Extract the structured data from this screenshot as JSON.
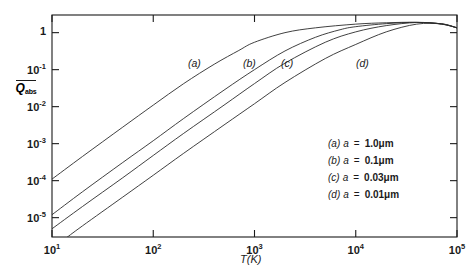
{
  "chart_data": {
    "type": "line",
    "title": "",
    "xlabel": "T(K)",
    "ylabel": "Q_abs",
    "ylabel_display": "Q",
    "ylabel_sub": "abs",
    "xscale": "log",
    "yscale": "log",
    "xlim": [
      10,
      100000
    ],
    "ylim": [
      3e-06,
      3
    ],
    "grid": false,
    "legend_position": "inside-lower-right",
    "xticks": [
      {
        "value": 10,
        "label": "10",
        "exp": "1"
      },
      {
        "value": 100,
        "label": "10",
        "exp": "2"
      },
      {
        "value": 1000,
        "label": "10",
        "exp": "3"
      },
      {
        "value": 10000,
        "label": "10",
        "exp": "4"
      },
      {
        "value": 100000,
        "label": "10",
        "exp": "5"
      }
    ],
    "yticks": [
      {
        "value": 1,
        "label": "1",
        "exp": ""
      },
      {
        "value": 0.1,
        "label": "10",
        "exp": "-1"
      },
      {
        "value": 0.01,
        "label": "10",
        "exp": "-2"
      },
      {
        "value": 0.001,
        "label": "10",
        "exp": "-3"
      },
      {
        "value": 0.0001,
        "label": "10",
        "exp": "-4"
      },
      {
        "value": 1e-05,
        "label": "10",
        "exp": "-5"
      }
    ],
    "series": [
      {
        "name": "a",
        "tag": "(a)",
        "grain_radius_um": 1.0,
        "tag_x": 188,
        "tag_y": 57,
        "points": [
          [
            10,
            0.00011
          ],
          [
            20,
            0.00045
          ],
          [
            50,
            0.0028
          ],
          [
            100,
            0.011
          ],
          [
            200,
            0.042
          ],
          [
            400,
            0.14
          ],
          [
            700,
            0.33
          ],
          [
            1000,
            0.55
          ],
          [
            2000,
            1.0
          ],
          [
            4000,
            1.35
          ],
          [
            10000,
            1.7
          ],
          [
            20000,
            1.85
          ],
          [
            40000,
            1.9
          ],
          [
            70000,
            1.7
          ],
          [
            100000,
            1.35
          ]
        ]
      },
      {
        "name": "b",
        "tag": "(b)",
        "grain_radius_um": 0.1,
        "tag_x": 243,
        "tag_y": 57,
        "points": [
          [
            10,
            1.2e-05
          ],
          [
            20,
            5e-05
          ],
          [
            50,
            0.00031
          ],
          [
            100,
            0.0012
          ],
          [
            200,
            0.0048
          ],
          [
            500,
            0.028
          ],
          [
            1000,
            0.1
          ],
          [
            2000,
            0.32
          ],
          [
            4000,
            0.75
          ],
          [
            7000,
            1.2
          ],
          [
            10000,
            1.45
          ],
          [
            20000,
            1.75
          ],
          [
            40000,
            1.9
          ],
          [
            70000,
            1.72
          ],
          [
            100000,
            1.35
          ]
        ]
      },
      {
        "name": "c",
        "tag": "(c)",
        "grain_radius_um": 0.03,
        "tag_x": 281,
        "tag_y": 57,
        "points": [
          [
            10,
            5e-06
          ],
          [
            20,
            2e-05
          ],
          [
            50,
            0.00012
          ],
          [
            100,
            0.00048
          ],
          [
            200,
            0.0019
          ],
          [
            500,
            0.011
          ],
          [
            1000,
            0.042
          ],
          [
            2000,
            0.15
          ],
          [
            5000,
            0.55
          ],
          [
            10000,
            1.05
          ],
          [
            20000,
            1.55
          ],
          [
            40000,
            1.88
          ],
          [
            70000,
            1.73
          ],
          [
            100000,
            1.35
          ]
        ]
      },
      {
        "name": "d",
        "tag": "(d)",
        "grain_radius_um": 0.01,
        "tag_x": 356,
        "tag_y": 57,
        "points": [
          [
            13,
            2.5e-06
          ],
          [
            20,
            6e-06
          ],
          [
            50,
            3.6e-05
          ],
          [
            100,
            0.00014
          ],
          [
            200,
            0.00055
          ],
          [
            500,
            0.0032
          ],
          [
            1000,
            0.012
          ],
          [
            2000,
            0.045
          ],
          [
            5000,
            0.2
          ],
          [
            10000,
            0.48
          ],
          [
            20000,
            1.05
          ],
          [
            40000,
            1.7
          ],
          [
            70000,
            1.74
          ],
          [
            100000,
            1.35
          ]
        ]
      }
    ]
  },
  "axes": {
    "xlabel_text": "T(K)",
    "ylabel_letter": "Q",
    "ylabel_sub": "abs"
  },
  "legend": {
    "entries": [
      {
        "key": "(a)",
        "var": "a",
        "eq": "=",
        "value": "1.0μm"
      },
      {
        "key": "(b)",
        "var": "a",
        "eq": "=",
        "value": "0.1μm"
      },
      {
        "key": "(c)",
        "var": "a",
        "eq": "=",
        "value": "0.03μm"
      },
      {
        "key": "(d)",
        "var": "a",
        "eq": "=",
        "value": "0.01μm"
      }
    ]
  },
  "colors": {
    "background": "#ffffff",
    "axis": "#1a1a1a",
    "curve": "#2b2b2b",
    "text": "#1a1a1a"
  }
}
